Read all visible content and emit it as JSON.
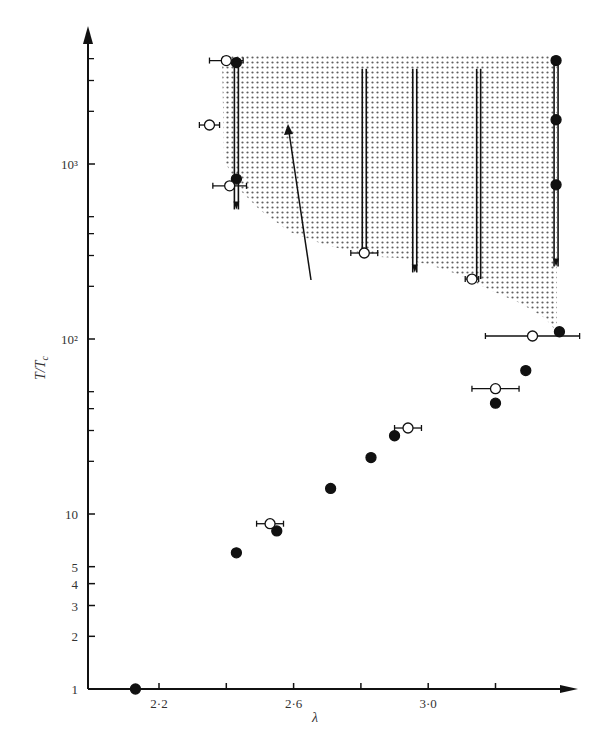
{
  "chart_data": {
    "type": "scatter",
    "title": "",
    "xlabel": "λ",
    "ylabel": "T/Tc",
    "yscale": "log",
    "xlim": [
      2.05,
      3.45
    ],
    "ylim": [
      1,
      5000
    ],
    "x_ticks": [
      {
        "value": 2.2,
        "label": "2·2"
      },
      {
        "value": 2.4,
        "label": ""
      },
      {
        "value": 2.6,
        "label": "2·6"
      },
      {
        "value": 2.8,
        "label": ""
      },
      {
        "value": 3.0,
        "label": "3·0"
      },
      {
        "value": 3.2,
        "label": ""
      }
    ],
    "y_ticks": [
      {
        "value": 1,
        "label": "1"
      },
      {
        "value": 2,
        "label": "2"
      },
      {
        "value": 3,
        "label": "3"
      },
      {
        "value": 4,
        "label": "4"
      },
      {
        "value": 5,
        "label": "5"
      },
      {
        "value": 10,
        "label": "10"
      },
      {
        "value": 100,
        "label": "10²"
      },
      {
        "value": 1000,
        "label": "10³"
      }
    ],
    "grid": false,
    "legend": null,
    "series": [
      {
        "name": "filled",
        "marker": "filled-circle",
        "points": [
          {
            "x": 2.13,
            "y": 1
          },
          {
            "x": 2.43,
            "y": 6.0
          },
          {
            "x": 2.55,
            "y": 8.0
          },
          {
            "x": 2.71,
            "y": 14
          },
          {
            "x": 2.83,
            "y": 21
          },
          {
            "x": 2.9,
            "y": 28
          },
          {
            "x": 3.2,
            "y": 43
          },
          {
            "x": 3.29,
            "y": 66
          },
          {
            "x": 3.39,
            "y": 110
          },
          {
            "x": 2.43,
            "y": 3800
          },
          {
            "x": 2.43,
            "y": 820
          },
          {
            "x": 3.38,
            "y": 3900
          },
          {
            "x": 3.38,
            "y": 1790
          },
          {
            "x": 3.38,
            "y": 760
          }
        ]
      },
      {
        "name": "open",
        "marker": "open-circle",
        "points": [
          {
            "x": 2.53,
            "y": 8.8,
            "xerr": 0.04
          },
          {
            "x": 2.94,
            "y": 31,
            "xerr": 0.04
          },
          {
            "x": 3.2,
            "y": 52,
            "xerr": 0.07
          },
          {
            "x": 3.31,
            "y": 104,
            "xerr": 0.14
          },
          {
            "x": 2.4,
            "y": 3900,
            "xerr": 0.05
          },
          {
            "x": 2.35,
            "y": 1670,
            "xerr": 0.03
          },
          {
            "x": 2.41,
            "y": 750,
            "xerr": 0.05
          },
          {
            "x": 2.81,
            "y": 310,
            "xerr": 0.04
          },
          {
            "x": 3.13,
            "y": 220,
            "xerr": 0.02
          }
        ]
      }
    ],
    "vertical_bars": [
      {
        "x": 2.43,
        "y_top": 3800,
        "y_bottom": 800,
        "arrow_down_to": 550
      },
      {
        "x": 2.81,
        "y_top": 3500,
        "y_bottom": 320
      },
      {
        "x": 2.96,
        "y_top": 3500,
        "arrow_down_to": 240
      },
      {
        "x": 3.15,
        "y_top": 3500,
        "y_bottom": 220
      },
      {
        "x": 3.38,
        "y_top": 3900,
        "arrow_down_to": 260
      }
    ],
    "annotations": [
      "shaded region (upper right, bounded below by curve from λ≈2.4,T≈700 to λ≈3.38,T≈110)",
      "arrow pointing up-left inside shaded region"
    ]
  }
}
